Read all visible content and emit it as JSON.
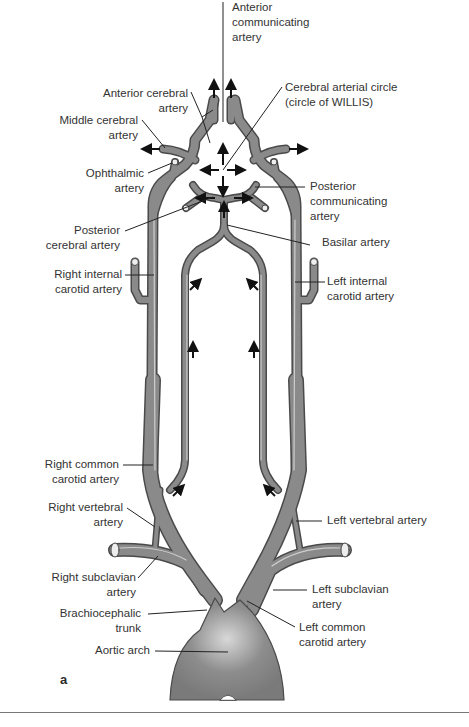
{
  "figure": {
    "panel_label": "a",
    "labels": {
      "anterior_communicating": "Anterior\ncommunicating\nartery",
      "anterior_cerebral": "Anterior cerebral\nartery",
      "circle_willis": "Cerebral arterial circle\n(circle of WILLIS)",
      "middle_cerebral": "Middle cerebral\nartery",
      "ophthalmic": "Ophthalmic\nartery",
      "posterior_communicating": "Posterior\ncommunicating\nartery",
      "posterior_cerebral": "Posterior\ncerebral artery",
      "basilar": "Basilar artery",
      "right_internal_carotid": "Right internal\ncarotid artery",
      "left_internal_carotid": "Left internal\ncarotid artery",
      "right_common_carotid": "Right common\ncarotid artery",
      "right_vertebral": "Right vertebral\nartery",
      "left_vertebral": "Left vertebral artery",
      "right_subclavian": "Right subclavian\nartery",
      "left_subclavian": "Left subclavian\nartery",
      "brachiocephalic": "Brachiocephalic\ntrunk",
      "left_common_carotid": "Left common\ncarotid artery",
      "aortic_arch": "Aortic arch"
    },
    "colors": {
      "vessel": "#8a8a8a",
      "vessel_edge": "#4a4a4a",
      "highlight": "#d6d6d6",
      "leader": "#222222"
    }
  }
}
